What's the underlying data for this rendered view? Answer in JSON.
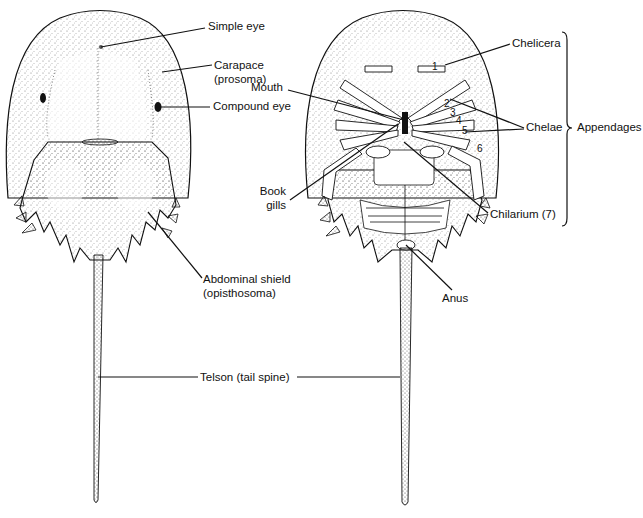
{
  "figure": {
    "views": [
      "dorsal",
      "ventral"
    ]
  },
  "labels": {
    "simple_eye": "Simple eye",
    "carapace_line1": "Carapace",
    "carapace_line2": "(prosoma)",
    "compound_eye": "Compound eye",
    "abdominal_line1": "Abdominal shield",
    "abdominal_line2": "(opisthosoma)",
    "telson": "Telson (tail spine)",
    "mouth": "Mouth",
    "book_line1": "Book",
    "book_line2": "gills",
    "chelicera": "Chelicera",
    "chelae": "Chelae",
    "appendages": "Appendages",
    "chilarium": "Chilarium (7)",
    "anus": "Anus"
  },
  "appendage_numbers": [
    "1",
    "2",
    "3",
    "4",
    "5",
    "6"
  ],
  "colors": {
    "ink": "#111111",
    "stipple": "#555555",
    "background": "#ffffff"
  }
}
